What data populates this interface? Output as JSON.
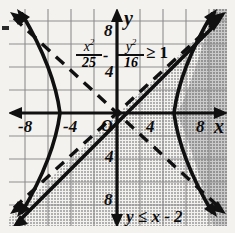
{
  "figure": {
    "axis_x_label": "x",
    "axis_y_label": "y",
    "origin_label": "O"
  },
  "ticks": {
    "x": [
      "-8",
      "-4",
      "4",
      "8"
    ],
    "y_top": "8",
    "y_upper": "4",
    "y_lower": "4",
    "y_bottom": "8"
  },
  "labels": {
    "hyperbola": {
      "term1_num": "x2",
      "term1_den": "25",
      "minus": "-",
      "term2_num": "y2",
      "term2_den": "16",
      "relation": "≥ 1",
      "full": "x²/25 - y²/16 ≥ 1"
    },
    "line": "y ≤ x - 2"
  },
  "colors": {
    "ink": "#101010",
    "paper": "#f4f2ef",
    "grid": "#8e8e8e",
    "shade_single": "#b9b9b9",
    "shade_double": "#8f8f8f"
  },
  "chart_data": {
    "type": "line",
    "xlabel": "x",
    "ylabel": "y",
    "xlim": [
      -10,
      10
    ],
    "ylim": [
      -10,
      10
    ],
    "grid": true,
    "grid_step": 2,
    "legend": "none",
    "xticks": [
      -8,
      -4,
      4,
      8
    ],
    "yticks": [
      -8,
      -4,
      4,
      8
    ],
    "series": [
      {
        "name": "hyperbola-left-branch",
        "style": "solid",
        "equation": "x^2/25 - y^2/16 = 1, x <= -5",
        "vertex": [
          -5,
          0
        ],
        "arrows": [
          "up-left",
          "down-left"
        ]
      },
      {
        "name": "hyperbola-right-branch",
        "style": "solid",
        "equation": "x^2/25 - y^2/16 = 1, x >= 5",
        "vertex": [
          5,
          0
        ],
        "arrows": [
          "up-right",
          "down-right"
        ]
      },
      {
        "name": "asymptote-positive",
        "style": "dashed",
        "equation": "y = 0.8x",
        "slope": 0.8,
        "intercept": 0
      },
      {
        "name": "asymptote-negative",
        "style": "dashed",
        "equation": "y = -0.8x",
        "slope": -0.8,
        "intercept": 0
      },
      {
        "name": "boundary-line",
        "style": "solid",
        "equation": "y = x - 2",
        "slope": 1,
        "intercept": -2,
        "arrows": [
          "up-right",
          "down-left"
        ]
      }
    ],
    "shaded_regions": [
      {
        "name": "half-plane-below-line",
        "inequality": "y <= x - 2",
        "fill": "single"
      },
      {
        "name": "hyperbola-interior-right",
        "inequality": "x^2/25 - y^2/16 >= 1",
        "fill": "single"
      },
      {
        "name": "solution-overlap",
        "inequality": "both",
        "fill": "double"
      }
    ]
  }
}
